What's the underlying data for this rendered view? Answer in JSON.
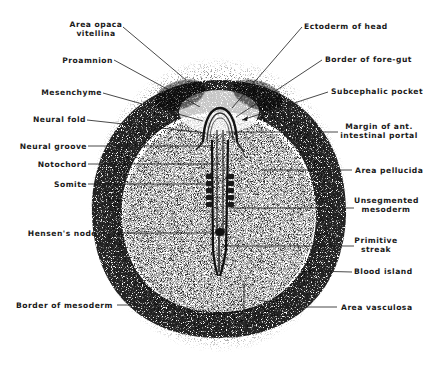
{
  "figure": {
    "labels_left": [
      {
        "id": "area-opaca-vitellina",
        "lines": [
          "Area opaca",
          "vitellina"
        ]
      },
      {
        "id": "proamnion",
        "lines": [
          "Proamnion"
        ]
      },
      {
        "id": "mesenchyme",
        "lines": [
          "Mesenchyme"
        ]
      },
      {
        "id": "neural-fold",
        "lines": [
          "Neural fold"
        ]
      },
      {
        "id": "neural-groove",
        "lines": [
          "Neural groove"
        ]
      },
      {
        "id": "notochord",
        "lines": [
          "Notochord"
        ]
      },
      {
        "id": "somite",
        "lines": [
          "Somite"
        ]
      },
      {
        "id": "hensens-node",
        "lines": [
          "Hensen's node"
        ]
      },
      {
        "id": "border-of-mesoderm",
        "lines": [
          "Border of mesoderm"
        ]
      }
    ],
    "labels_right": [
      {
        "id": "ectoderm-of-head",
        "lines": [
          "Ectoderm of head"
        ]
      },
      {
        "id": "border-of-fore-gut",
        "lines": [
          "Border of fore-gut"
        ]
      },
      {
        "id": "subcephalic-pocket",
        "lines": [
          "Subcephalic pocket"
        ]
      },
      {
        "id": "margin-ant-intestinal-portal",
        "lines": [
          "Margin of ant.",
          "intestinal portal"
        ]
      },
      {
        "id": "area-pellucida",
        "lines": [
          "Area pellucida"
        ]
      },
      {
        "id": "unsegmented-mesoderm",
        "lines": [
          "Unsegmented",
          "mesoderm"
        ]
      },
      {
        "id": "primitive-streak",
        "lines": [
          "Primitive",
          "streak"
        ]
      },
      {
        "id": "blood-island",
        "lines": [
          "Blood island"
        ]
      },
      {
        "id": "area-vasculosa",
        "lines": [
          "Area vasculosa"
        ]
      }
    ],
    "colors": {
      "ink": "#1a1a1a",
      "stipple": "#2a2a2a",
      "background": "#ffffff"
    }
  }
}
